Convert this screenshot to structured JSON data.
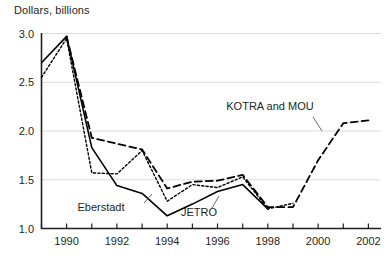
{
  "chart_data": {
    "type": "line",
    "title": "Dollars, billions",
    "xlabel": "",
    "ylabel": "Dollars, billions",
    "xlim": [
      1989,
      2002.5
    ],
    "ylim": [
      1.0,
      3.0
    ],
    "yticks": [
      "3.0",
      "2.5",
      "2.0",
      "1.5",
      "1.0"
    ],
    "ytick_values": [
      3.0,
      2.5,
      2.0,
      1.5,
      1.0
    ],
    "xticks": [
      "1990",
      "1992",
      "1994",
      "1996",
      "1998",
      "2000",
      "2002"
    ],
    "xtick_values": [
      1990,
      1992,
      1994,
      1996,
      1998,
      2000,
      2002
    ],
    "xminor_values": [
      1989,
      1991,
      1993,
      1995,
      1997,
      1999,
      2001
    ],
    "grid": "horizontal",
    "legend": "inline-annotations",
    "series": [
      {
        "name": "Eberstadt",
        "style": "solid",
        "x": [
          1989,
          1990,
          1991,
          1992,
          1993,
          1994,
          1995,
          1996,
          1997,
          1998
        ],
        "values": [
          2.7,
          2.97,
          1.83,
          1.44,
          1.36,
          1.13,
          1.25,
          1.38,
          1.45,
          1.2
        ]
      },
      {
        "name": "JETRO",
        "style": "dotted",
        "x": [
          1989,
          1990,
          1991,
          1992,
          1993,
          1994,
          1995,
          1996,
          1997,
          1998,
          1999
        ],
        "values": [
          2.55,
          2.95,
          1.57,
          1.56,
          1.8,
          1.28,
          1.45,
          1.42,
          1.53,
          1.2,
          1.26
        ]
      },
      {
        "name": "KOTRA and MOU",
        "style": "dashed",
        "x": [
          1990,
          1991,
          1992,
          1993,
          1994,
          1995,
          1996,
          1997,
          1998,
          1999,
          2000,
          2001,
          2002
        ],
        "values": [
          2.97,
          1.93,
          1.87,
          1.81,
          1.41,
          1.48,
          1.49,
          1.55,
          1.22,
          1.22,
          1.7,
          2.08,
          2.11
        ]
      }
    ],
    "annotations": [
      {
        "text": "Eberstadt",
        "x_px": 101,
        "y_px": 211
      },
      {
        "text": "JETRO",
        "x_px": 199,
        "y_px": 216
      },
      {
        "text": "KOTRA and MOU",
        "x_px": 270,
        "y_px": 110
      }
    ]
  }
}
